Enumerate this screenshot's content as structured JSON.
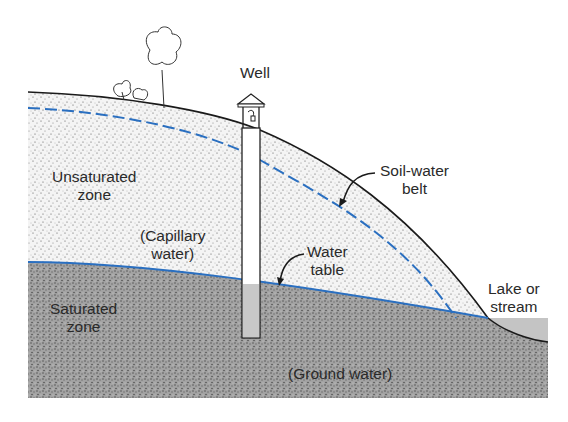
{
  "figure": {
    "type": "cross-section diagram"
  },
  "labels": {
    "well": "Well",
    "unsaturated_zone": [
      "Unsaturated",
      "zone"
    ],
    "capillary_water": [
      "(Capillary",
      "water)"
    ],
    "soil_water_belt": [
      "Soil-water",
      "belt"
    ],
    "water_table": [
      "Water",
      "table"
    ],
    "lake_or_stream": [
      "Lake or",
      "stream"
    ],
    "saturated_zone": [
      "Saturated",
      "zone"
    ],
    "ground_water": "(Ground water)"
  },
  "colors": {
    "unsaturated_fill": "#f2f2f2",
    "saturated_fill": "#9a9a9a",
    "water_line": "#2a6fc0",
    "outline": "#1a1a1a",
    "lake": "#c4c4c4",
    "well_water": "#c8c8c8",
    "text": "#2a2a2a"
  }
}
